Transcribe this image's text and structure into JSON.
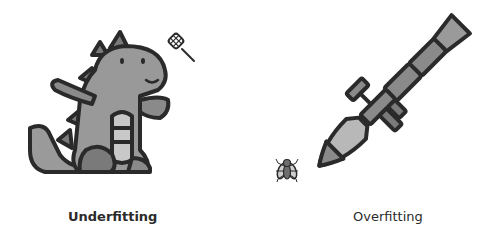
{
  "panels": [
    {
      "id": "underfitting",
      "caption": "Underfitting",
      "illustration": "dinosaur-with-fly-swatter",
      "tool_icon": "fly-swatter-icon",
      "subject_icon": "dinosaur-icon"
    },
    {
      "id": "overfitting",
      "caption": "Overfitting",
      "illustration": "rocket-launcher-aimed-at-fly",
      "tool_icon": "rocket-launcher-icon",
      "subject_icon": "fly-icon"
    }
  ],
  "colors": {
    "outline": "#2a2a2a",
    "fill_mid": "#8c8c8c",
    "fill_light": "#b8b8b8",
    "fill_dark": "#6e6e6e",
    "background": "#ffffff",
    "caption": "#2b2b2b"
  }
}
